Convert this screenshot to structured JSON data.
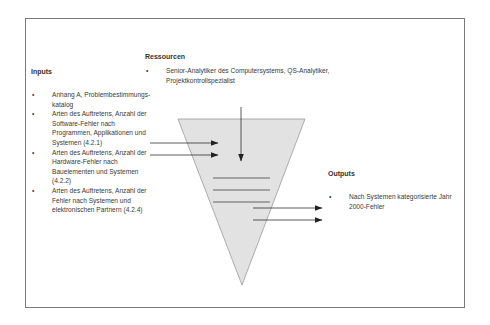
{
  "diagram": {
    "type": "process-funnel",
    "colors": {
      "funnel_fill": "#e2e2e2",
      "funnel_stroke": "#9a9a9a",
      "arrow": "#333333",
      "frame": "#7a7a7a",
      "text": "#3a3a3a"
    },
    "resources": {
      "heading": "Ressourcen",
      "items": [
        {
          "bullet": "•",
          "text": "Senior-Analytiker des Computersystems, QS-Analytiker, Projektkontrollspezialist"
        }
      ]
    },
    "inputs": {
      "heading": "Inputs",
      "items": [
        {
          "bullet": "•",
          "text": "Anhang A, Problembestimmungs-katalog"
        },
        {
          "bullet": "•",
          "text": "Arten des Auftretens, Anzahl der Software-Fehler nach Programmen, Applikationen und Systemen (4.2.1)"
        },
        {
          "bullet": "•",
          "text": "Arten des Auftretens, Anzahl der Hardware-Fehler nach Bauelementen und Systemen (4.2.2)"
        },
        {
          "bullet": "•",
          "text": "Arten des Auftretens, Anzahl der Fehler nach Systemen und elektronischen Partnern (4.2.4)"
        }
      ]
    },
    "outputs": {
      "heading": "Outputs",
      "items": [
        {
          "bullet": "•",
          "text": "Nach Systemen kategorisierte Jahr 2000-Fehler"
        }
      ]
    }
  }
}
